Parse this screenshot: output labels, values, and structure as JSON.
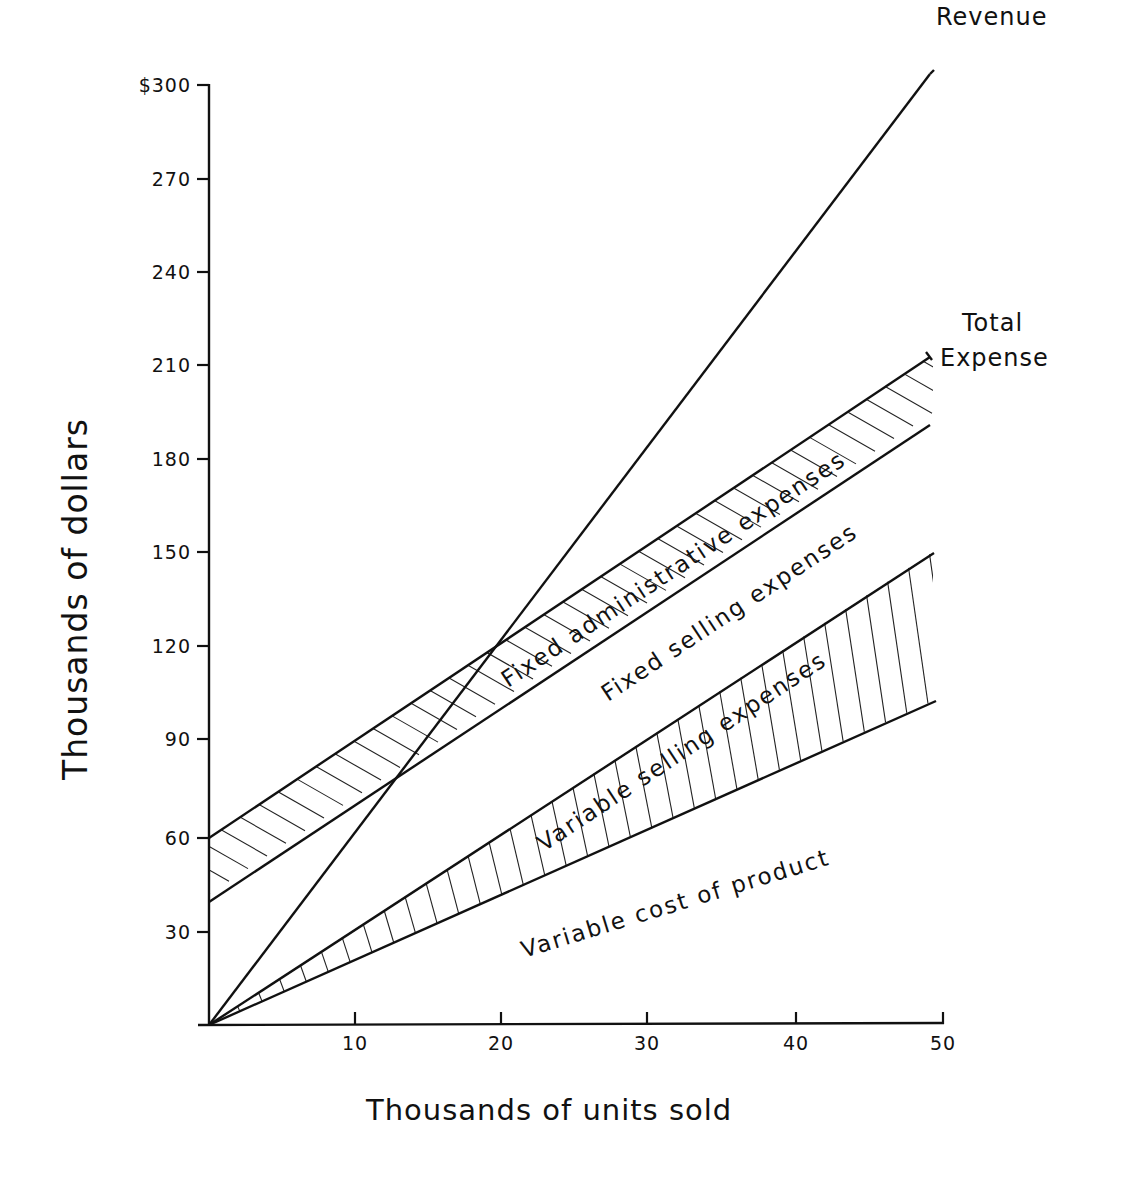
{
  "chart_data": {
    "type": "line",
    "title": "",
    "xlabel": "Thousands of units sold",
    "ylabel": "Thousands of dollars",
    "xlim": [
      0,
      50
    ],
    "ylim": [
      0,
      300
    ],
    "x_ticks": [
      "10",
      "20",
      "30",
      "40",
      "50"
    ],
    "y_ticks": [
      "30",
      "60",
      "90",
      "120",
      "150",
      "180",
      "210",
      "240",
      "270",
      "$300"
    ],
    "grid": false,
    "legend": "direct labels",
    "x": [
      0,
      10,
      20,
      30,
      40,
      50
    ],
    "series": [
      {
        "name": "Revenue",
        "values": [
          0,
          61,
          122,
          183,
          244,
          305
        ]
      },
      {
        "name": "Total Expense",
        "values": [
          60,
          91,
          122,
          153,
          184,
          215
        ]
      },
      {
        "name": "Fixed selling expenses (top) / admin band bottom",
        "values": [
          40,
          71,
          102,
          133,
          164,
          195
        ]
      },
      {
        "name": "Variable selling expenses (top)",
        "values": [
          0,
          31,
          62,
          93,
          124,
          154
        ]
      },
      {
        "name": "Variable cost of product",
        "values": [
          0,
          21,
          42,
          63,
          84,
          105
        ]
      }
    ],
    "bands": [
      {
        "name": "Fixed administrative expenses",
        "between": [
          "Total Expense",
          "Fixed selling expenses (top) / admin band bottom"
        ],
        "fill": "diagonal hatch"
      },
      {
        "name": "Fixed selling expenses",
        "between": [
          "Fixed selling expenses (top) / admin band bottom",
          "Variable selling expenses (top)"
        ],
        "fill": "none"
      },
      {
        "name": "Variable selling expenses",
        "between": [
          "Variable selling expenses (top)",
          "Variable cost of product"
        ],
        "fill": "vertical hatch"
      },
      {
        "name": "Variable cost of product",
        "between": [
          "Variable cost of product",
          "x-axis"
        ],
        "fill": "none"
      }
    ],
    "annotations": [
      "Revenue",
      "Total Expense",
      "Fixed administrative expenses",
      "Fixed selling expenses",
      "Variable selling expenses",
      "Variable cost of product"
    ],
    "break_even": {
      "units": 19,
      "dollars": 118
    }
  },
  "labels": {
    "revenue": "Revenue",
    "total_line1": "Total",
    "total_line2": "Expense",
    "fixed_admin": "Fixed administrative expenses",
    "fixed_selling": "Fixed selling expenses",
    "variable_selling": "Variable selling expenses",
    "variable_cost": "Variable cost of product",
    "xlabel": "Thousands of units sold",
    "ylabel": "Thousands of dollars"
  },
  "yticks": [
    {
      "label": "$300",
      "y": 85
    },
    {
      "label": "270",
      "y": 179
    },
    {
      "label": "240",
      "y": 272
    },
    {
      "label": "210",
      "y": 365
    },
    {
      "label": "180",
      "y": 459
    },
    {
      "label": "150",
      "y": 552
    },
    {
      "label": "120",
      "y": 646
    },
    {
      "label": "90",
      "y": 739
    },
    {
      "label": "60",
      "y": 838
    },
    {
      "label": "30",
      "y": 932
    }
  ],
  "xticks": [
    {
      "label": "10",
      "x": 355
    },
    {
      "label": "20",
      "x": 501
    },
    {
      "label": "30",
      "x": 647
    },
    {
      "label": "40",
      "x": 796
    },
    {
      "label": "50",
      "x": 943
    }
  ]
}
